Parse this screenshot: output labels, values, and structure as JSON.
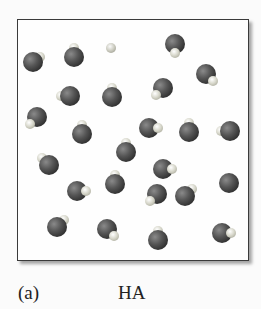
{
  "figure": {
    "panel_label": "(a)",
    "caption": "HA",
    "colors": {
      "box_border": "#3a3a3a",
      "a_atom": "#3d3d3d",
      "h_atom": "#d8d8cc",
      "background": "#fbfbfb"
    }
  },
  "molecules": [
    {
      "x": 33,
      "y": 62,
      "h": "ur"
    },
    {
      "x": 74,
      "y": 57,
      "h": "t"
    },
    {
      "x": 175,
      "y": 44,
      "h": "b"
    },
    {
      "x": 206,
      "y": 74,
      "h": "br"
    },
    {
      "x": 70,
      "y": 96,
      "h": "l"
    },
    {
      "x": 112,
      "y": 97,
      "h": "t"
    },
    {
      "x": 163,
      "y": 88,
      "h": "bl"
    },
    {
      "x": 37,
      "y": 117,
      "h": "bl"
    },
    {
      "x": 82,
      "y": 134,
      "h": "t"
    },
    {
      "x": 149,
      "y": 128,
      "h": "r"
    },
    {
      "x": 189,
      "y": 132,
      "h": "t"
    },
    {
      "x": 230,
      "y": 131,
      "h": "l"
    },
    {
      "x": 126,
      "y": 152,
      "h": "t"
    },
    {
      "x": 49,
      "y": 165,
      "h": "tl"
    },
    {
      "x": 163,
      "y": 169,
      "h": "r"
    },
    {
      "x": 229,
      "y": 183,
      "h": "none"
    },
    {
      "x": 77,
      "y": 191,
      "h": "r"
    },
    {
      "x": 115,
      "y": 184,
      "h": "t"
    },
    {
      "x": 157,
      "y": 194,
      "h": "bl"
    },
    {
      "x": 185,
      "y": 196,
      "h": "tr"
    },
    {
      "x": 57,
      "y": 227,
      "h": "tr"
    },
    {
      "x": 107,
      "y": 229,
      "h": "br"
    },
    {
      "x": 158,
      "y": 240,
      "h": "t"
    },
    {
      "x": 222,
      "y": 233,
      "h": "r"
    }
  ],
  "lone_particles": [
    {
      "x": 111,
      "y": 48
    }
  ]
}
